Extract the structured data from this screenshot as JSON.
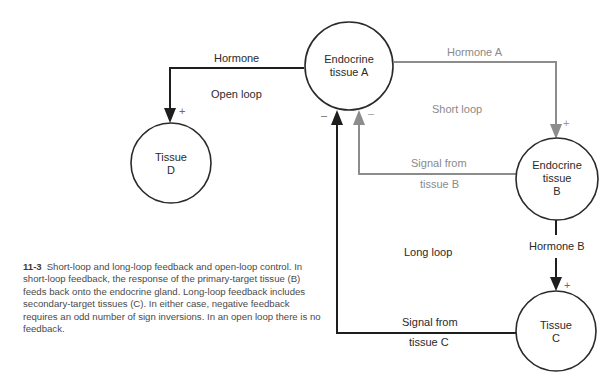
{
  "colors": {
    "black_path": "#1e1e1e",
    "gray_path": "#8c8c8c",
    "circle_stroke": "#2a2a2a",
    "text": "#2a2a2a",
    "gray_text": "#8a8a8a",
    "caption_text": "#4a4a4a"
  },
  "nodes": {
    "endocrine_a": {
      "line1": "Endocrine",
      "line2": "tissue A"
    },
    "endocrine_b": {
      "line1": "Endocrine",
      "line2": "tissue",
      "line3": "B"
    },
    "tissue_c": {
      "line1": "Tissue",
      "line2": "C"
    },
    "tissue_d": {
      "line1": "Tissue",
      "line2": "D"
    }
  },
  "edges": {
    "hormone": "Hormone",
    "hormone_a": "Hormone  A",
    "hormone_b": "Hormone B",
    "signal_b_line1": "Signal from",
    "signal_b_line2": "tissue B",
    "signal_c_line1": "Signal from",
    "signal_c_line2": "tissue C"
  },
  "loops": {
    "open": "Open loop",
    "short": "Short  loop",
    "long": "Long loop"
  },
  "signs": {
    "plus": "+",
    "minus": "–"
  },
  "caption": {
    "figure_number": "11-3",
    "text": "Short-loop and long-loop feedback and open-loop control. In short-loop feedback, the response of the primary-target tissue (B) feeds back onto the endocrine gland. Long-loop feedback includes secondary-target tissues (C). In either case, negative feedback requires an odd number of sign inversions. In an open loop there is no feedback."
  }
}
